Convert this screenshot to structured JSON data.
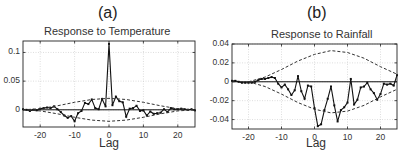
{
  "chart_data": [
    {
      "type": "line",
      "panel_label": "(a)",
      "title": "Response to Temperature",
      "xlabel": "Lag",
      "ylabel": "",
      "xlim": [
        -25,
        25
      ],
      "ylim": [
        -0.03,
        0.12
      ],
      "xticks": [
        -20,
        -10,
        0,
        10,
        20
      ],
      "xtick_labels": [
        "-20",
        "-10",
        "0",
        "10",
        "20"
      ],
      "yticks": [
        0,
        0.05,
        0.1
      ],
      "ytick_labels": [
        "0",
        "0.05",
        "0.1"
      ],
      "grid": true,
      "series": [
        {
          "name": "response",
          "style": "solid-markers",
          "x": [
            -25,
            -24,
            -23,
            -22,
            -21,
            -20,
            -19,
            -18,
            -17,
            -16,
            -15,
            -14,
            -13,
            -12,
            -11,
            -10,
            -9,
            -8,
            -7,
            -6,
            -5,
            -4,
            -3,
            -2,
            -1,
            0,
            1,
            2,
            3,
            4,
            5,
            6,
            7,
            8,
            9,
            10,
            11,
            12,
            13,
            14,
            15,
            16,
            17,
            18,
            19,
            20,
            21,
            22,
            23,
            24,
            25
          ],
          "values": [
            0.001,
            0.0,
            -0.002,
            0.0,
            -0.001,
            0.002,
            0.003,
            0.004,
            0.003,
            0.006,
            0.001,
            -0.004,
            -0.01,
            -0.014,
            -0.011,
            -0.02,
            -0.006,
            -0.002,
            0.012,
            0.01,
            0.018,
            0.003,
            0.001,
            0.019,
            0.006,
            0.115,
            0.008,
            0.023,
            0.015,
            0.013,
            -0.012,
            0.002,
            0.003,
            0.007,
            -0.002,
            -0.001,
            -0.01,
            -0.003,
            -0.007,
            -0.006,
            -0.005,
            0.001,
            -0.004,
            0.003,
            0.001,
            0.001,
            0.002,
            0.001,
            0.0,
            0.001,
            -0.001
          ]
        },
        {
          "name": "upper confidence bound",
          "style": "dashed",
          "x": [
            -25,
            -20,
            -15,
            -10,
            -5,
            0,
            5,
            10,
            15,
            20,
            25
          ],
          "values": [
            0.0,
            0.002,
            0.007,
            0.013,
            0.018,
            0.02,
            0.018,
            0.013,
            0.007,
            0.002,
            0.0
          ]
        },
        {
          "name": "lower confidence bound",
          "style": "dashed",
          "x": [
            -25,
            -20,
            -15,
            -10,
            -5,
            0,
            5,
            10,
            15,
            20,
            25
          ],
          "values": [
            0.0,
            -0.002,
            -0.007,
            -0.013,
            -0.018,
            -0.02,
            -0.018,
            -0.013,
            -0.007,
            -0.002,
            0.0
          ]
        }
      ]
    },
    {
      "type": "line",
      "panel_label": "(b)",
      "title": "Response to Rainfall",
      "xlabel": "Lag",
      "ylabel": "",
      "xlim": [
        -25,
        25
      ],
      "ylim": [
        -0.05,
        0.04
      ],
      "xticks": [
        -20,
        -10,
        0,
        10,
        20
      ],
      "xtick_labels": [
        "-20",
        "-10",
        "0",
        "10",
        "20"
      ],
      "yticks": [
        -0.04,
        -0.02,
        0,
        0.02,
        0.04
      ],
      "ytick_labels": [
        "-0.04",
        "-0.02",
        "0",
        "0.02",
        "0.04"
      ],
      "grid": true,
      "series": [
        {
          "name": "response",
          "style": "solid-markers",
          "x": [
            -25,
            -24,
            -23,
            -22,
            -21,
            -20,
            -19,
            -18,
            -17,
            -16,
            -15,
            -14,
            -13,
            -12,
            -11,
            -10,
            -9,
            -8,
            -7,
            -6,
            -5,
            -4,
            -3,
            -2,
            -1,
            0,
            1,
            2,
            3,
            4,
            5,
            6,
            7,
            8,
            9,
            10,
            11,
            12,
            13,
            14,
            15,
            16,
            17,
            18,
            19,
            20,
            21,
            22,
            23,
            24,
            25
          ],
          "values": [
            0.001,
            0.001,
            0.0,
            -0.001,
            -0.001,
            -0.001,
            -0.001,
            0.0,
            0.002,
            0.003,
            0.003,
            0.004,
            0.005,
            0.004,
            -0.002,
            -0.006,
            -0.003,
            -0.008,
            -0.014,
            -0.009,
            0.006,
            -0.01,
            -0.018,
            -0.004,
            -0.005,
            -0.028,
            -0.047,
            -0.045,
            -0.03,
            -0.018,
            -0.005,
            -0.025,
            -0.042,
            -0.03,
            -0.027,
            -0.022,
            0.003,
            -0.024,
            -0.019,
            -0.006,
            -0.005,
            -0.001,
            -0.008,
            -0.012,
            -0.019,
            -0.013,
            -0.002,
            -0.003,
            -0.002,
            -0.004,
            0.007
          ]
        },
        {
          "name": "upper confidence bound",
          "style": "dashed",
          "x": [
            -20,
            -15,
            -10,
            -5,
            0,
            5,
            10,
            15,
            20,
            25
          ],
          "values": [
            0.0,
            0.005,
            0.013,
            0.022,
            0.029,
            0.033,
            0.031,
            0.025,
            0.016,
            0.008
          ]
        },
        {
          "name": "lower confidence bound",
          "style": "dashed",
          "x": [
            -20,
            -15,
            -10,
            -5,
            0,
            5,
            10,
            15,
            20,
            25
          ],
          "values": [
            0.0,
            -0.005,
            -0.013,
            -0.022,
            -0.029,
            -0.033,
            -0.031,
            -0.025,
            -0.016,
            -0.008
          ]
        }
      ]
    }
  ]
}
